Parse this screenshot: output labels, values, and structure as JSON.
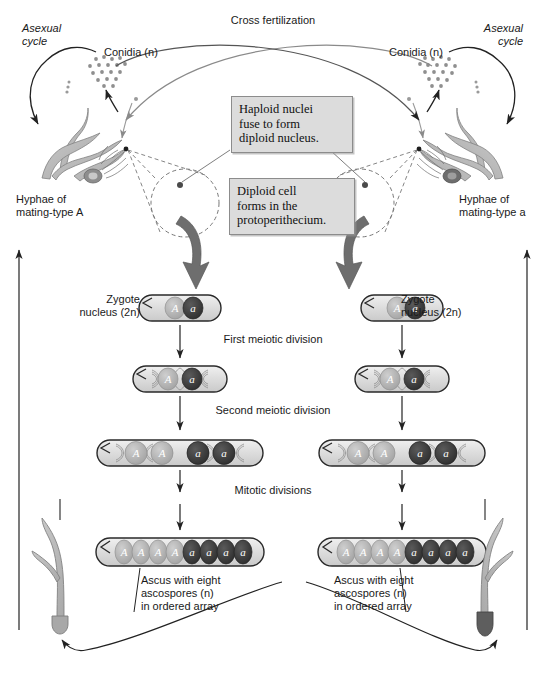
{
  "figure": {
    "title": "Cross fertilization"
  },
  "labels": {
    "asexual_cycle_left": "Asexual\ncycle",
    "asexual_cycle_right": "Asexual\ncycle",
    "conidia_left": "Conidia (n)",
    "conidia_right": "Conidia (n)",
    "hyphae_left": "Hyphae of\nmating-type A",
    "hyphae_right": "Hyphae of\nmating-type a",
    "zygote_left": "Zygote\nnucleus (2n)",
    "zygote_right": "Zygote\nnucleus (2n)",
    "first_meiotic": "First meiotic division",
    "second_meiotic": "Second meiotic division",
    "mitotic": "Mitotic divisions",
    "ascus_caption_left": "Ascus with eight\nascospores (n)\nin ordered array",
    "ascus_caption_right": "Ascus with eight\nascospores (n)\nin ordered array"
  },
  "callouts": [
    {
      "id": "haploid-fusion",
      "text": "Haploid nuclei\nfuse to form\ndiploid nucleus."
    },
    {
      "id": "diploid-cell",
      "text": "Diploid cell\nforms in the\nprotoperithecium."
    }
  ],
  "stages": [
    {
      "id": "zygote",
      "name": "Zygote nucleus (2n)",
      "nuclei": [
        "A",
        "a"
      ],
      "nuclei_count": 2,
      "spindles": false
    },
    {
      "id": "first-meiotic",
      "name": "First meiotic division",
      "nuclei": [
        "A",
        "a"
      ],
      "nuclei_count": 2,
      "spindles": true
    },
    {
      "id": "second-meiotic",
      "name": "Second meiotic division",
      "nuclei": [
        "A",
        "A",
        "a",
        "a"
      ],
      "nuclei_count": 4,
      "spindles": true
    },
    {
      "id": "mitotic",
      "name": "Mitotic divisions",
      "nuclei": [
        "A",
        "A",
        "A",
        "A",
        "a",
        "a",
        "a",
        "a"
      ],
      "nuclei_count": 8,
      "spindles": false
    }
  ],
  "mating_types": {
    "A": {
      "symbol": "A",
      "color": "#b0b0b0"
    },
    "a": {
      "symbol": "a",
      "color": "#3d3d3d"
    }
  },
  "colors": {
    "hypha_fill": "#b9b9b9",
    "hypha_stroke": "#7a7a7a",
    "ascus_fill": "#dedede",
    "ascus_stroke": "#2a2a2a",
    "nucleus_light": "#b0b0b0",
    "nucleus_dark": "#3d3d3d",
    "callout_bg": "#dcdcdc",
    "callout_border": "#8c8c8c",
    "arrow_dark": "#222222",
    "arrow_gray": "#8a8a8a",
    "thick_arrow": "#6e6e6e",
    "text": "#1a1a1a"
  }
}
